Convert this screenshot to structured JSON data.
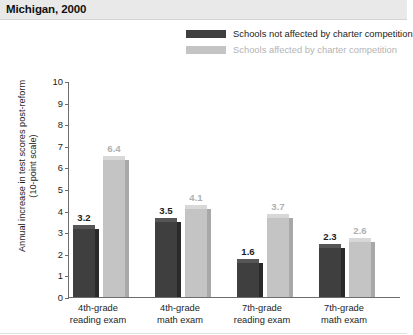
{
  "title": "Michigan, 2000",
  "legend": {
    "items": [
      {
        "label": "Schools not affected by charter competition",
        "color": "#3f3f3f",
        "key": "not_affected"
      },
      {
        "label": "Schools affected by charter competition",
        "color": "#c4c4c4",
        "key": "affected"
      }
    ]
  },
  "axis": {
    "y_title_line1": "Annual increase in test scores post-reform",
    "y_title_line2": "(10-point scale)",
    "y_ticks": [
      "0",
      "1",
      "2",
      "3",
      "4",
      "5",
      "6",
      "7",
      "8",
      "9",
      "10"
    ]
  },
  "chart_data": {
    "type": "bar",
    "title": "Michigan, 2000",
    "xlabel": "",
    "ylabel": "Annual increase in test scores post-reform (10-point scale)",
    "ylim": [
      0,
      10
    ],
    "grid": false,
    "legend_position": "top-right",
    "categories": [
      "4th-grade reading exam",
      "4th-grade math exam",
      "7th-grade reading exam",
      "7th-grade math exam"
    ],
    "category_lines": [
      [
        "4th-grade",
        "reading exam"
      ],
      [
        "4th-grade",
        "math exam"
      ],
      [
        "7th-grade",
        "reading exam"
      ],
      [
        "7th-grade",
        "math exam"
      ]
    ],
    "series": [
      {
        "name": "Schools not affected by charter competition",
        "color": "#3f3f3f",
        "values": [
          3.2,
          3.5,
          1.6,
          2.3
        ],
        "labels": [
          "3.2",
          "3.5",
          "1.6",
          "2.3"
        ]
      },
      {
        "name": "Schools affected by charter competition",
        "color": "#c4c4c4",
        "values": [
          6.4,
          4.1,
          3.7,
          2.6
        ],
        "labels": [
          "6.4",
          "4.1",
          "3.7",
          "2.6"
        ]
      }
    ]
  }
}
